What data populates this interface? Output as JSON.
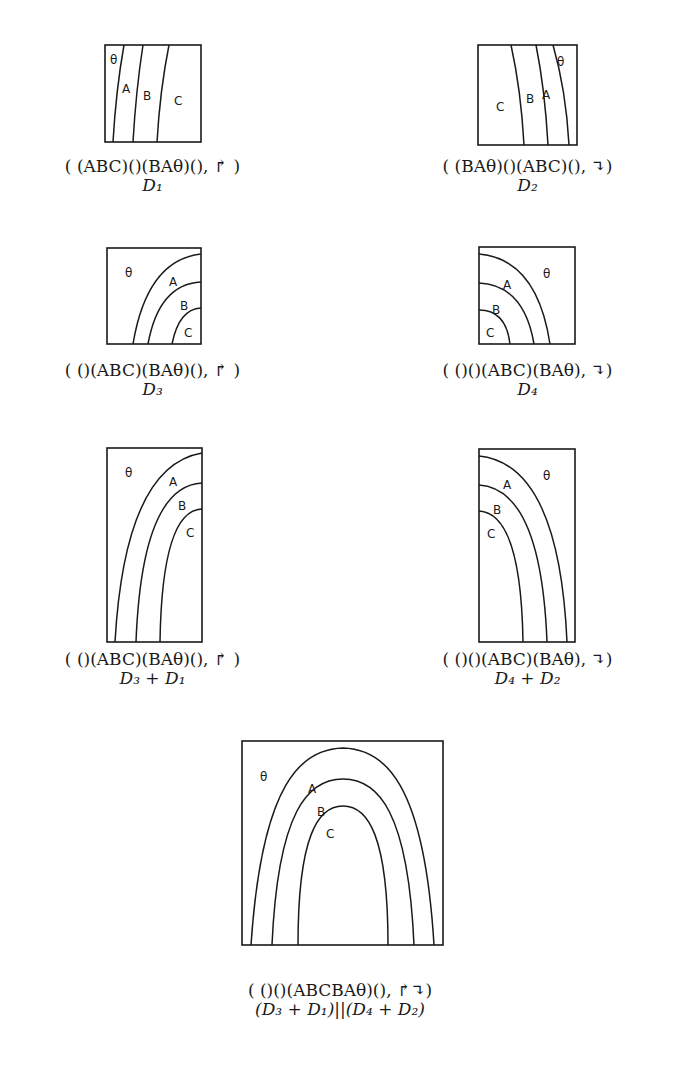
{
  "figure": {
    "region_labels": {
      "theta": "θ",
      "a": "A",
      "b": "B",
      "c": "C"
    },
    "arrows": {
      "up_right": "↱",
      "down_hook": "↴"
    },
    "panels": [
      {
        "id": "d1",
        "formula": "( (ABC)()(BAθ)(), ↱ )",
        "name": "D₁"
      },
      {
        "id": "d2",
        "formula": "( (BAθ)()(ABC)(), ↴)",
        "name": "D₂"
      },
      {
        "id": "d3",
        "formula": "( ()(ABC)(BAθ)(), ↱ )",
        "name": "D₃"
      },
      {
        "id": "d4",
        "formula": "( ()()(ABC)(BAθ), ↴)",
        "name": "D₄"
      },
      {
        "id": "d3d1",
        "formula": "( ()(ABC)(BAθ)(), ↱ )",
        "name": "D₃ + D₁"
      },
      {
        "id": "d4d2",
        "formula": "( ()()(ABC)(BAθ), ↴)",
        "name": "D₄ + D₂"
      },
      {
        "id": "combined",
        "formula": "( ()()(ABCBAθ)(), ↱↴)",
        "name": "(D₃ + D₁)||(D₄ + D₂)"
      }
    ]
  }
}
